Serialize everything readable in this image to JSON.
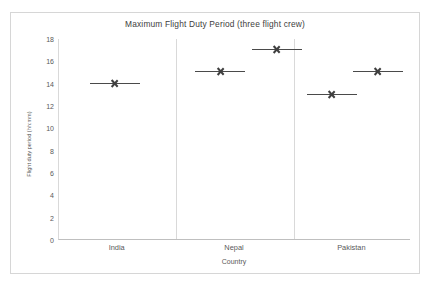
{
  "chart_data": {
    "type": "scatter",
    "title": "Maximum Flight Duty Period (three flight crew)",
    "xlabel": "Country",
    "ylabel": "Flight duty period (hh:mm)",
    "categories": [
      "India",
      "Nepal",
      "Pakistan"
    ],
    "ylim": [
      0,
      18
    ],
    "yticks": [
      0,
      2,
      4,
      6,
      8,
      10,
      12,
      14,
      16,
      18
    ],
    "ytick_labels": [
      "0",
      "2",
      "4",
      "6",
      "8",
      "10",
      "12",
      "14",
      "16",
      "18"
    ],
    "grid": false,
    "legend": "none",
    "marker_style": "x-with-horizontal-line",
    "marker_color": "#404040",
    "panel_dividers": true,
    "points": [
      {
        "category": "India",
        "x_frac": 0.158,
        "value": 14.05
      },
      {
        "category": "Nepal",
        "x_frac": 0.458,
        "value": 15.1
      },
      {
        "category": "Nepal",
        "x_frac": 0.618,
        "value": 17.1
      },
      {
        "category": "Pakistan",
        "x_frac": 0.775,
        "value": 13.05
      },
      {
        "category": "Pakistan",
        "x_frac": 0.905,
        "value": 15.1
      }
    ]
  },
  "colors": {
    "frame_border": "#d6d6d6",
    "axis_line": "#bfbfbf",
    "divider": "#d9d9d9",
    "text": "#595959",
    "title_text": "#404040",
    "marker": "#404040",
    "background": "#ffffff"
  }
}
